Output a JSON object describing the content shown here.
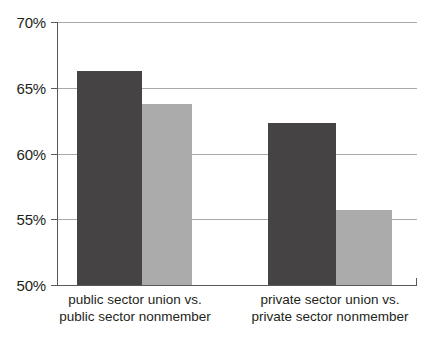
{
  "chart_data": {
    "type": "bar",
    "title": "",
    "subtitle": "",
    "xlabel": "",
    "ylabel": "",
    "categories": [
      "public sector union vs. public sector nonmember",
      "private sector union vs. private sector nonmember"
    ],
    "category_lines": [
      [
        "public sector union vs.",
        "public sector nonmember"
      ],
      [
        "private sector union vs.",
        "private sector nonmember"
      ]
    ],
    "series": [
      {
        "name": "union",
        "color": "#454343",
        "values": [
          66.3,
          62.3
        ]
      },
      {
        "name": "nonmember",
        "color": "#ababab",
        "values": [
          63.8,
          55.7
        ]
      }
    ],
    "ylim": [
      50,
      70
    ],
    "ytick_values": [
      70,
      65,
      60,
      55,
      50
    ],
    "ytick_labels": [
      "70%",
      "65%",
      "60%",
      "55%",
      "50%"
    ],
    "grid": true,
    "grid_color": "#a7a9ac",
    "axis_color": "#58595b",
    "legend": "none",
    "background": "#ffffff"
  }
}
